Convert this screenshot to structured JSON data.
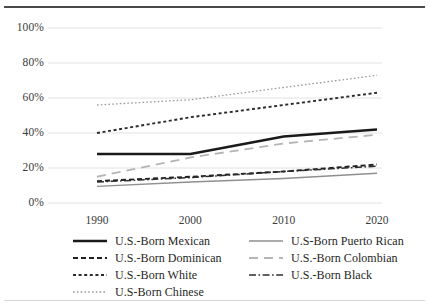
{
  "figure": {
    "top_rule": true,
    "bottom_rule": true
  },
  "axes": {
    "ytick_labels": [
      "100%",
      "80%",
      "60%",
      "40%",
      "20%",
      "0%"
    ],
    "xtick_labels": [
      "1990",
      "2000",
      "2010",
      "2020"
    ]
  },
  "legend": {
    "items": [
      {
        "label": "U.S.-Born Mexican",
        "style": "solid-thick",
        "color": "#1a1a1a",
        "col": 0,
        "row": 0
      },
      {
        "label": "U.S-Born Puerto Rican",
        "style": "solid-thin",
        "color": "#8f8f8f",
        "col": 1,
        "row": 0
      },
      {
        "label": "U.S.-Born Dominican",
        "style": "dashed",
        "color": "#1f1f1f",
        "col": 0,
        "row": 1
      },
      {
        "label": "U.S.-Born Colombian",
        "style": "long-dash",
        "color": "#b5b5b5",
        "col": 1,
        "row": 1
      },
      {
        "label": "U.S.-Born White",
        "style": "dotted-med",
        "color": "#2b2b2b",
        "col": 0,
        "row": 2
      },
      {
        "label": "U.S.-Born Black",
        "style": "dash-dot",
        "color": "#2e2e2e",
        "col": 1,
        "row": 2
      },
      {
        "label": "U.S-Born Chinese",
        "style": "dotted-fine",
        "color": "#9a9a9a",
        "col": 0,
        "row": 3
      }
    ]
  },
  "chart_data": {
    "type": "line",
    "title": "",
    "xlabel": "",
    "ylabel": "",
    "x": [
      "1990",
      "2000",
      "2010",
      "2020"
    ],
    "ylim": [
      0,
      100
    ],
    "yticks": [
      0,
      20,
      40,
      60,
      80,
      100
    ],
    "grid": "horizontal",
    "legend_position": "bottom",
    "series": [
      {
        "name": "U.S-Born Chinese",
        "values": [
          56,
          59,
          66,
          73
        ],
        "style": "dotted-fine",
        "color": "#9a9a9a",
        "width": 1.3
      },
      {
        "name": "U.S.-Born White",
        "values": [
          40,
          49,
          56,
          63
        ],
        "style": "dotted-med",
        "color": "#2b2b2b",
        "width": 1.9
      },
      {
        "name": "U.S.-Born Mexican",
        "values": [
          28,
          28,
          38,
          42
        ],
        "style": "solid-thick",
        "color": "#1a1a1a",
        "width": 2.4
      },
      {
        "name": "U.S.-Born Colombian",
        "values": [
          15,
          26,
          34,
          39
        ],
        "style": "long-dash",
        "color": "#b5b5b5",
        "width": 1.8
      },
      {
        "name": "U.S.-Born Dominican",
        "values": [
          12.5,
          15,
          18,
          22
        ],
        "style": "dashed",
        "color": "#1f1f1f",
        "width": 1.9
      },
      {
        "name": "U.S.-Born Black",
        "values": [
          12,
          14.5,
          18,
          21
        ],
        "style": "dash-dot",
        "color": "#2e2e2e",
        "width": 1.5
      },
      {
        "name": "U.S-Born Puerto Rican",
        "values": [
          9.5,
          12,
          14,
          17
        ],
        "style": "solid-thin",
        "color": "#8f8f8f",
        "width": 1.5
      }
    ]
  }
}
